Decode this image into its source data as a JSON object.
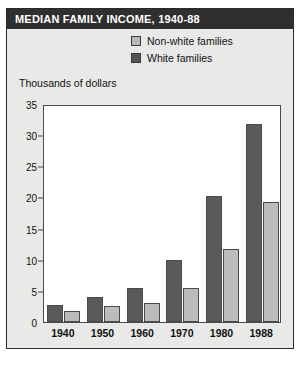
{
  "figure": {
    "title": "MEDIAN FAMILY INCOME, 1940-88",
    "axis_label": "Thousands of dollars",
    "source_note": ""
  },
  "legend": {
    "items": [
      {
        "label": "Non-white families",
        "color": "#b9b9b7",
        "icon": "legend-swatch-icon"
      },
      {
        "label": "White families",
        "color": "#555555",
        "icon": "legend-swatch-icon"
      }
    ]
  },
  "colors": {
    "title_bar": "#2f2f2f",
    "title_text": "#ffffff",
    "panel_background": "#e9e9e7",
    "plot_background": "#ffffff",
    "axis": "#4a4a4a",
    "white_families": "#5a5a5a",
    "nonwhite_families": "#bcbcba"
  },
  "chart_data": {
    "type": "bar",
    "title": "MEDIAN FAMILY INCOME, 1940-88",
    "xlabel": "",
    "ylabel": "Thousands of dollars",
    "ylim": [
      0,
      35
    ],
    "yticks": [
      0,
      5,
      10,
      15,
      20,
      25,
      30,
      35
    ],
    "ytick_labels": [
      "0",
      "5",
      "10",
      "15",
      "20",
      "25",
      "30",
      "35"
    ],
    "grid": false,
    "legend_position": "top-right",
    "categories": [
      "1940",
      "1950",
      "1960",
      "1970",
      "1980",
      "1988"
    ],
    "series": [
      {
        "name": "White families",
        "values": [
          2.8,
          4.0,
          5.4,
          10.0,
          20.3,
          31.8
        ]
      },
      {
        "name": "Non-white families",
        "values": [
          1.8,
          2.6,
          3.1,
          5.4,
          11.8,
          19.2
        ]
      }
    ]
  }
}
